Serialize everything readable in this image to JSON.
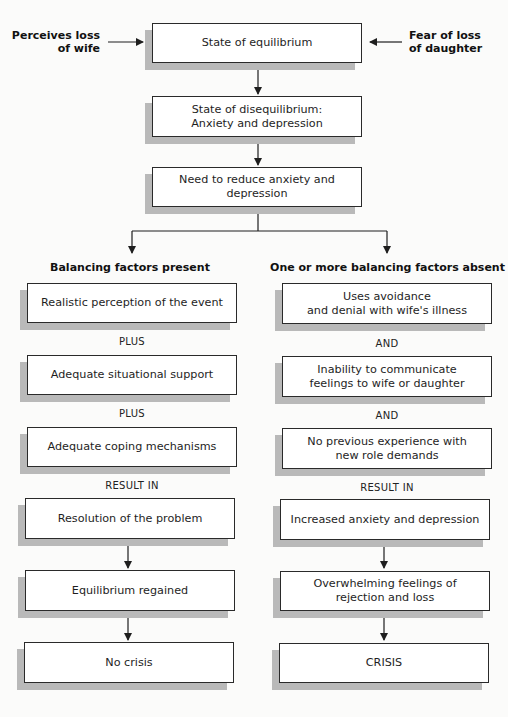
{
  "diagram": {
    "inputs": {
      "left": "Perceives loss\nof wife",
      "right": "Fear of loss\nof daughter"
    },
    "top_chain": [
      "State of equilibrium",
      "State of disequilibrium:\nAnxiety and depression",
      "Need to reduce anxiety and depression"
    ],
    "left_branch": {
      "heading": "Balancing factors present",
      "factors": [
        "Realistic perception of the event",
        "Adequate situational support",
        "Adequate coping mechanisms"
      ],
      "connectors": [
        "PLUS",
        "PLUS"
      ],
      "result_label": "RESULT IN",
      "outcomes": [
        "Resolution of the problem",
        "Equilibrium regained",
        "No crisis"
      ]
    },
    "right_branch": {
      "heading": "One or more balancing factors absent",
      "factors": [
        "Uses avoidance\nand denial with wife's illness",
        "Inability to communicate\nfeelings to wife or daughter",
        "No previous experience with\nnew role demands"
      ],
      "connectors": [
        "AND",
        "AND"
      ],
      "result_label": "RESULT IN",
      "outcomes": [
        "Increased anxiety and depression",
        "Overwhelming feelings of\nrejection and loss",
        "CRISIS"
      ]
    },
    "colors": {
      "border": "#2a2a2a",
      "shadow": "#b9b9b9",
      "background": "#fbfbfa"
    }
  }
}
